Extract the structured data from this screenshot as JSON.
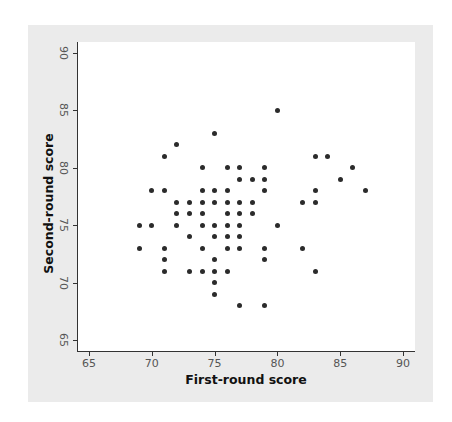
{
  "chart_data": {
    "type": "scatter",
    "title": "",
    "xlabel": "First-round score",
    "ylabel": "Second-round score",
    "xlim": [
      64,
      91
    ],
    "ylim": [
      64,
      91
    ],
    "xticks": [
      65,
      70,
      75,
      80,
      85,
      90
    ],
    "yticks": [
      65,
      70,
      75,
      80,
      85,
      90
    ],
    "grid": false,
    "legend": null,
    "marker_color": "#2b2b2b",
    "points": [
      [
        80,
        85
      ],
      [
        75,
        83
      ],
      [
        72,
        82
      ],
      [
        71,
        81
      ],
      [
        83,
        81
      ],
      [
        84,
        81
      ],
      [
        74,
        80
      ],
      [
        76,
        80
      ],
      [
        77,
        80
      ],
      [
        79,
        80
      ],
      [
        86,
        80
      ],
      [
        77,
        79
      ],
      [
        78,
        79
      ],
      [
        79,
        79
      ],
      [
        85,
        79
      ],
      [
        70,
        78
      ],
      [
        71,
        78
      ],
      [
        74,
        78
      ],
      [
        75,
        78
      ],
      [
        76,
        78
      ],
      [
        79,
        78
      ],
      [
        83,
        78
      ],
      [
        87,
        78
      ],
      [
        72,
        77
      ],
      [
        73,
        77
      ],
      [
        74,
        77
      ],
      [
        75,
        77
      ],
      [
        76,
        77
      ],
      [
        77,
        77
      ],
      [
        78,
        77
      ],
      [
        82,
        77
      ],
      [
        83,
        77
      ],
      [
        72,
        76
      ],
      [
        73,
        76
      ],
      [
        74,
        76
      ],
      [
        76,
        76
      ],
      [
        77,
        76
      ],
      [
        78,
        76
      ],
      [
        69,
        75
      ],
      [
        70,
        75
      ],
      [
        72,
        75
      ],
      [
        74,
        75
      ],
      [
        75,
        75
      ],
      [
        76,
        75
      ],
      [
        77,
        75
      ],
      [
        80,
        75
      ],
      [
        73,
        74
      ],
      [
        75,
        74
      ],
      [
        76,
        74
      ],
      [
        77,
        74
      ],
      [
        69,
        73
      ],
      [
        71,
        73
      ],
      [
        74,
        73
      ],
      [
        76,
        73
      ],
      [
        77,
        73
      ],
      [
        79,
        73
      ],
      [
        82,
        73
      ],
      [
        71,
        72
      ],
      [
        75,
        72
      ],
      [
        79,
        72
      ],
      [
        71,
        71
      ],
      [
        73,
        71
      ],
      [
        74,
        71
      ],
      [
        75,
        71
      ],
      [
        76,
        71
      ],
      [
        83,
        71
      ],
      [
        75,
        70
      ],
      [
        75,
        69
      ],
      [
        77,
        68
      ],
      [
        79,
        68
      ]
    ]
  },
  "labels": {
    "x_title": "First-round score",
    "y_title": "Second-round score",
    "x_ticks": [
      "65",
      "70",
      "75",
      "80",
      "85",
      "90"
    ],
    "y_ticks": [
      "65",
      "70",
      "75",
      "80",
      "85",
      "90"
    ]
  },
  "colors": {
    "panel_background": "#ebebeb",
    "plot_background": "#ffffff",
    "marker": "#2b2b2b"
  }
}
